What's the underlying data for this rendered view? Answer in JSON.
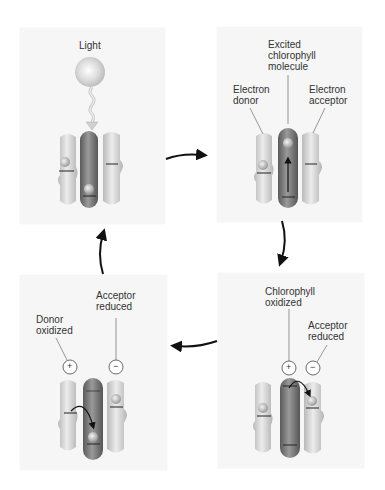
{
  "colors": {
    "panel_bg": "#f6f6f6",
    "pigment_light": "#d6d6d6",
    "chlorophyll_dark": "#7a7a7a",
    "arrow": "#111111"
  },
  "panels": [
    {
      "id": "step1",
      "position": "top-left",
      "labels": {
        "light": "Light"
      },
      "state": "Light absorbed by chlorophyll"
    },
    {
      "id": "step2",
      "position": "top-right",
      "labels": {
        "excited": "Excited\nchlorophyll\nmolecule",
        "donor": "Electron\ndonor",
        "acceptor": "Electron\nacceptor"
      }
    },
    {
      "id": "step3",
      "position": "bottom-right",
      "labels": {
        "chlorophyll_oxidized": "Chlorophyll\noxidized",
        "acceptor_reduced": "Acceptor\nreduced"
      },
      "charges": [
        "+",
        "−"
      ]
    },
    {
      "id": "step4",
      "position": "bottom-left",
      "labels": {
        "donor_oxidized": "Donor\noxidized",
        "acceptor_reduced": "Acceptor\nreduced"
      },
      "charges": [
        "+",
        "−"
      ]
    }
  ],
  "electron_symbol": "e⁻",
  "cycle_arrows": [
    "step1→step2",
    "step2→step3",
    "step3→step4",
    "step4→step1"
  ]
}
